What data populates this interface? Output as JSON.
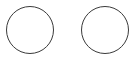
{
  "circles": [
    {
      "id": "left",
      "label": "",
      "selected": false,
      "stroke_color": "#3a3a3a",
      "fill_color": "#ffffff"
    },
    {
      "id": "right",
      "label": "",
      "selected": false,
      "stroke_color": "#3a3a3a",
      "fill_color": "#ffffff"
    }
  ],
  "background_color": "#ffffff"
}
